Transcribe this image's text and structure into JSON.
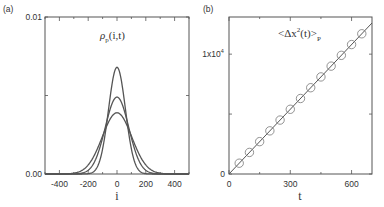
{
  "chart_data": [
    {
      "panel": "(a)",
      "type": "line",
      "title": "ρp(i,t)",
      "title_main": "ρ",
      "title_sub": "p",
      "title_rest": "(i,t)",
      "xlabel": "i",
      "ylabel": "",
      "xlim": [
        -500,
        500
      ],
      "ylim": [
        0,
        0.01
      ],
      "xticks": [
        -400,
        -200,
        0,
        200,
        400
      ],
      "xtick_labels": [
        "-400",
        "-200",
        "0",
        "200",
        "400"
      ],
      "yticks": [
        0,
        0.01
      ],
      "ytick_labels": [
        "0.00",
        "0.01"
      ],
      "grid": false,
      "series": [
        {
          "name": "t1",
          "shape": "gaussian",
          "center": 0,
          "peak": 0.0068,
          "sigma": 58.7
        },
        {
          "name": "t2",
          "shape": "gaussian",
          "center": 0,
          "peak": 0.0049,
          "sigma": 81.4
        },
        {
          "name": "t3",
          "shape": "gaussian",
          "center": 0,
          "peak": 0.0039,
          "sigma": 102.3
        }
      ],
      "line_color": "#555555"
    },
    {
      "panel": "(b)",
      "type": "scatter",
      "title": "<Δx²(t)>p",
      "title_main": "<Δx",
      "title_sup": "2",
      "title_mid": "(t)>",
      "title_sub": "P",
      "xlabel": "t",
      "ylabel": "",
      "xlim": [
        0,
        700
      ],
      "ylim": [
        0,
        13100
      ],
      "xticks": [
        0,
        300,
        600
      ],
      "xtick_labels": [
        "0",
        "300",
        "600"
      ],
      "yticks": [
        0,
        10000
      ],
      "ytick_labels": [
        "0",
        "1x10⁴"
      ],
      "ytick_label_base": "1x10",
      "ytick_label_exp": "4",
      "grid": false,
      "series": [
        {
          "name": "simulation",
          "marker": "open-circle",
          "x": [
            50,
            100,
            150,
            200,
            250,
            300,
            350,
            400,
            450,
            500,
            550,
            600,
            650
          ],
          "y": [
            900,
            1800,
            2700,
            3600,
            4500,
            5400,
            6300,
            7200,
            8100,
            9000,
            9900,
            10800,
            11700
          ]
        },
        {
          "name": "linear-fit",
          "line": "solid",
          "x": [
            0,
            700
          ],
          "y": [
            0,
            12600
          ]
        }
      ],
      "line_color": "#555555",
      "marker_color": "#777777"
    }
  ]
}
